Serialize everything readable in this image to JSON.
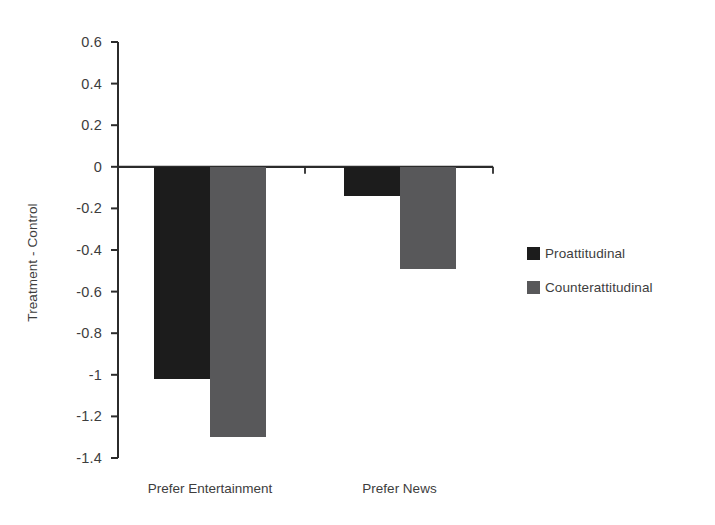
{
  "chart_data": {
    "type": "bar",
    "title": "",
    "xlabel": "",
    "ylabel": "Treatment - Control",
    "categories": [
      "Prefer Entertainment",
      "Prefer News"
    ],
    "series": [
      {
        "name": "Proattitudinal",
        "values": [
          -1.02,
          -0.14
        ],
        "color": "#1c1c1c"
      },
      {
        "name": "Counterattitudinal",
        "values": [
          -1.3,
          -0.49
        ],
        "color": "#58585a"
      }
    ],
    "ylim": [
      -1.4,
      0.6
    ],
    "ytick_values": [
      0.6,
      0.4,
      0.2,
      0,
      -0.2,
      -0.4,
      -0.6,
      -0.8,
      -1,
      -1.2,
      -1.4
    ],
    "ytick_labels": [
      "0.6",
      "0.4",
      "0.2",
      "0",
      "-0.2",
      "-0.4",
      "-0.6",
      "-0.8",
      "-1",
      "-1.2",
      "-1.4"
    ],
    "grid": false,
    "legend_position": "right",
    "zero_line": 0,
    "axis_color": "#2b2b2b",
    "background": "#ffffff"
  },
  "legend": {
    "entries": [
      {
        "label": "Proattitudinal",
        "color": "#1c1c1c"
      },
      {
        "label": "Counterattitudinal",
        "color": "#58585a"
      }
    ]
  }
}
